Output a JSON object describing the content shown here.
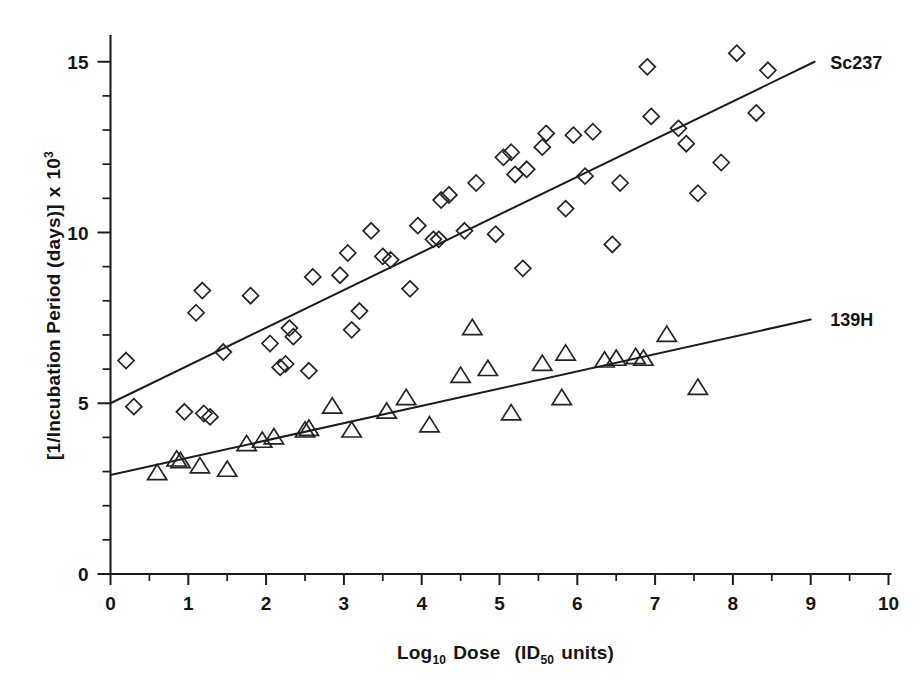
{
  "chart_data": {
    "type": "scatter",
    "title": "",
    "xlabel": "Log10 Dose  (ID50 units)",
    "ylabel": "[1/Incubation Period (days)] x 10^3",
    "xlim": [
      0,
      10
    ],
    "ylim": [
      0,
      16
    ],
    "grid": false,
    "legend_position": "inline-right-of-line-ends",
    "x_ticks_major": [
      0,
      1,
      2,
      3,
      4,
      5,
      6,
      7,
      8,
      9,
      10
    ],
    "x_tick_labels": [
      "0",
      "1",
      "2",
      "3",
      "4",
      "5",
      "6",
      "7",
      "8",
      "9",
      "10"
    ],
    "x_ticks_minor_step": 0.5,
    "y_ticks_major": [
      0,
      5,
      10,
      15
    ],
    "y_tick_labels": [
      "0",
      "5",
      "10",
      "15"
    ],
    "y_ticks_minor_step": 1,
    "series": [
      {
        "name": "Sc237",
        "marker": "diamond",
        "label": "Sc237",
        "label_x": 9.25,
        "label_y": 14.95,
        "fit_line": {
          "x0": 0.0,
          "y0": 5.0,
          "x1": 9.05,
          "y1": 15.0
        },
        "points": [
          [
            0.2,
            6.25
          ],
          [
            0.3,
            4.9
          ],
          [
            0.95,
            4.75
          ],
          [
            1.2,
            4.7
          ],
          [
            1.28,
            4.6
          ],
          [
            1.18,
            8.3
          ],
          [
            1.1,
            7.65
          ],
          [
            1.45,
            6.5
          ],
          [
            1.8,
            8.15
          ],
          [
            2.05,
            6.75
          ],
          [
            2.18,
            6.05
          ],
          [
            2.25,
            6.15
          ],
          [
            2.3,
            7.2
          ],
          [
            2.35,
            6.95
          ],
          [
            2.6,
            8.7
          ],
          [
            2.55,
            5.95
          ],
          [
            2.95,
            8.75
          ],
          [
            3.05,
            9.4
          ],
          [
            3.2,
            7.7
          ],
          [
            3.1,
            7.15
          ],
          [
            3.35,
            10.05
          ],
          [
            3.5,
            9.3
          ],
          [
            3.6,
            9.2
          ],
          [
            3.85,
            8.35
          ],
          [
            3.95,
            10.2
          ],
          [
            4.15,
            9.8
          ],
          [
            4.22,
            9.8
          ],
          [
            4.35,
            11.1
          ],
          [
            4.25,
            10.95
          ],
          [
            4.55,
            10.05
          ],
          [
            4.7,
            11.45
          ],
          [
            4.95,
            9.95
          ],
          [
            5.05,
            12.2
          ],
          [
            5.2,
            11.7
          ],
          [
            5.15,
            12.35
          ],
          [
            5.35,
            11.85
          ],
          [
            5.3,
            8.95
          ],
          [
            5.55,
            12.5
          ],
          [
            5.6,
            12.9
          ],
          [
            5.85,
            10.7
          ],
          [
            5.95,
            12.85
          ],
          [
            6.2,
            12.95
          ],
          [
            6.1,
            11.65
          ],
          [
            6.45,
            9.65
          ],
          [
            6.55,
            11.45
          ],
          [
            6.9,
            14.85
          ],
          [
            6.95,
            13.4
          ],
          [
            7.3,
            13.05
          ],
          [
            7.4,
            12.6
          ],
          [
            7.55,
            11.15
          ],
          [
            7.85,
            12.05
          ],
          [
            8.05,
            15.25
          ],
          [
            8.3,
            13.5
          ],
          [
            8.45,
            14.75
          ]
        ]
      },
      {
        "name": "139H",
        "marker": "triangle",
        "label": "139H",
        "label_x": 9.25,
        "label_y": 7.45,
        "fit_line": {
          "x0": 0.0,
          "y0": 2.9,
          "x1": 9.0,
          "y1": 7.45
        },
        "points": [
          [
            0.6,
            2.95
          ],
          [
            0.85,
            3.35
          ],
          [
            0.9,
            3.3
          ],
          [
            1.15,
            3.15
          ],
          [
            1.5,
            3.05
          ],
          [
            1.75,
            3.8
          ],
          [
            1.95,
            3.9
          ],
          [
            2.1,
            4.0
          ],
          [
            2.5,
            4.2
          ],
          [
            2.55,
            4.25
          ],
          [
            2.85,
            4.9
          ],
          [
            3.1,
            4.2
          ],
          [
            3.55,
            4.75
          ],
          [
            3.8,
            5.15
          ],
          [
            4.1,
            4.35
          ],
          [
            4.5,
            5.8
          ],
          [
            4.65,
            7.2
          ],
          [
            4.85,
            6.0
          ],
          [
            5.15,
            4.7
          ],
          [
            5.55,
            6.15
          ],
          [
            5.85,
            6.45
          ],
          [
            5.8,
            5.15
          ],
          [
            6.35,
            6.25
          ],
          [
            6.5,
            6.3
          ],
          [
            6.75,
            6.35
          ],
          [
            6.85,
            6.3
          ],
          [
            7.15,
            7.0
          ],
          [
            7.55,
            5.45
          ]
        ]
      }
    ]
  },
  "axis_titles": {
    "y_prefix": "[1/Incubation Period (days)]",
    "y_mult": "x",
    "y_base": "10",
    "y_exponent": "3",
    "x_log": "Log",
    "x_log_sub": "10",
    "x_dose": "Dose",
    "x_open": "(ID",
    "x_id_sub": "50",
    "x_units": "units)"
  },
  "style": {
    "background": "#ffffff",
    "ink": "#1c1c1c",
    "marker_stroke": "#232323"
  }
}
